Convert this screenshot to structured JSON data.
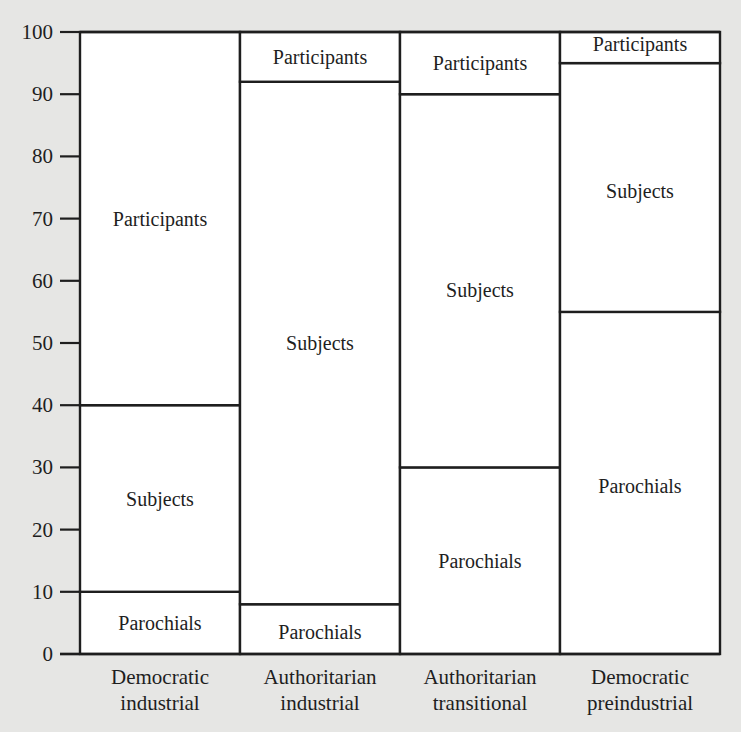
{
  "chart_data": {
    "type": "bar",
    "stacked": true,
    "title": "",
    "xlabel": "",
    "ylabel": "",
    "ylim": [
      0,
      100
    ],
    "yticks": [
      0,
      10,
      20,
      30,
      40,
      50,
      60,
      70,
      80,
      90,
      100
    ],
    "grid": false,
    "legend": "none (segments labeled inline)",
    "categories": [
      [
        "Democratic",
        "industrial"
      ],
      [
        "Authoritarian",
        "industrial"
      ],
      [
        "Authoritarian",
        "transitional"
      ],
      [
        "Democratic",
        "preindustrial"
      ]
    ],
    "series": [
      {
        "name": "Parochials",
        "values": [
          10,
          8,
          30,
          55
        ]
      },
      {
        "name": "Subjects",
        "values": [
          30,
          84,
          60,
          40
        ]
      },
      {
        "name": "Participants",
        "values": [
          60,
          8,
          10,
          5
        ]
      }
    ],
    "cumulative_boundaries": [
      [
        0,
        10,
        40,
        100
      ],
      [
        0,
        8,
        92,
        100
      ],
      [
        0,
        30,
        90,
        100
      ],
      [
        0,
        55,
        95,
        100
      ]
    ],
    "segment_label_positions": [
      [
        5,
        25,
        70
      ],
      [
        3.5,
        50,
        96
      ],
      [
        15,
        58.5,
        95
      ],
      [
        27,
        74.5,
        98
      ]
    ]
  }
}
